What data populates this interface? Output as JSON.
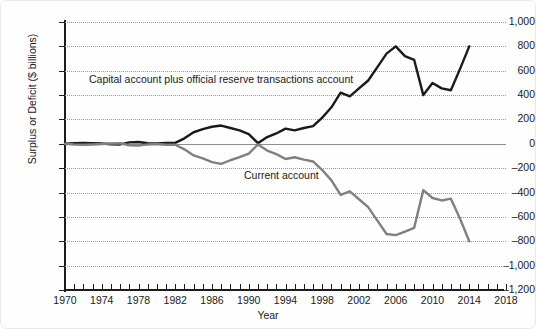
{
  "chart_data": {
    "type": "line",
    "title": "",
    "xlabel": "Year",
    "ylabel": "Surplus or Deficit ($ billions)",
    "xlim": [
      1970,
      2018
    ],
    "ylim": [
      -1200,
      1000
    ],
    "grid": true,
    "legend_position": "inline-annotations",
    "xticks": [
      1970,
      1974,
      1978,
      1982,
      1986,
      1990,
      1994,
      1998,
      2002,
      2006,
      2010,
      2014,
      2018
    ],
    "xtick_step": 1,
    "yticks": [
      1000,
      800,
      600,
      400,
      200,
      0,
      -200,
      -400,
      -600,
      -800,
      -1000,
      -1200
    ],
    "ytick_labels": [
      "1,000",
      "800",
      "600",
      "400",
      "200",
      "0",
      "–200",
      "–400",
      "–600",
      "–800",
      "–1,000",
      "–1,200"
    ],
    "x": [
      1970,
      1971,
      1972,
      1973,
      1974,
      1975,
      1976,
      1977,
      1978,
      1979,
      1980,
      1981,
      1982,
      1983,
      1984,
      1985,
      1986,
      1987,
      1988,
      1989,
      1990,
      1991,
      1992,
      1993,
      1994,
      1995,
      1996,
      1997,
      1998,
      1999,
      2000,
      2001,
      2002,
      2003,
      2004,
      2005,
      2006,
      2007,
      2008,
      2009,
      2010,
      2011,
      2012,
      2013,
      2014
    ],
    "series": [
      {
        "name": "Capital account plus official reserve transactions account",
        "color": "#1a1a1a",
        "label_text": "Capital account plus official reserve transactions account",
        "values": [
          0,
          5,
          8,
          5,
          2,
          -3,
          -5,
          12,
          15,
          5,
          2,
          8,
          8,
          45,
          95,
          120,
          140,
          150,
          130,
          110,
          80,
          5,
          55,
          85,
          125,
          110,
          130,
          145,
          215,
          300,
          420,
          390,
          455,
          520,
          630,
          740,
          800,
          720,
          690,
          400,
          500,
          455,
          440,
          615,
          800
        ]
      },
      {
        "name": "Current account",
        "color": "#808080",
        "label_text": "Current account",
        "values": [
          0,
          -5,
          -8,
          -5,
          -2,
          3,
          5,
          -12,
          -15,
          -5,
          -2,
          -8,
          -8,
          -45,
          -95,
          -120,
          -150,
          -165,
          -135,
          -110,
          -80,
          -5,
          -55,
          -85,
          -125,
          -110,
          -130,
          -145,
          -215,
          -300,
          -420,
          -390,
          -455,
          -520,
          -630,
          -740,
          -750,
          -720,
          -690,
          -380,
          -445,
          -465,
          -450,
          -615,
          -800
        ]
      }
    ]
  },
  "axis_titles": {
    "y": "Surplus or Deficit ($ billions)",
    "x": "Year"
  },
  "annotations": {
    "capital": "Capital account plus official reserve transactions account",
    "current": "Current account"
  },
  "colors": {
    "capital_line": "#1a1a1a",
    "current_line": "#808080",
    "grid": "#9a9a9a",
    "axis": "#1c1c1c",
    "zero_axis": "#8e8e8e",
    "background": "#fefefe"
  }
}
